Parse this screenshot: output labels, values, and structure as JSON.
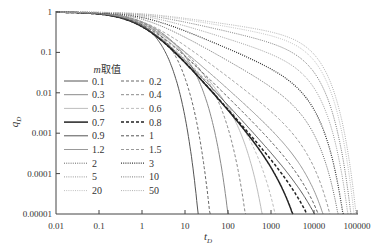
{
  "chart_data": {
    "type": "line",
    "title": "",
    "xlabel": "t_D",
    "ylabel": "q_D",
    "xscale": "log",
    "yscale": "log",
    "xlim": [
      0.01,
      100000
    ],
    "ylim": [
      1e-05,
      1
    ],
    "x_ticks": [
      "0.01",
      "0.1",
      "1",
      "10",
      "100",
      "1000",
      "10000",
      "100000"
    ],
    "y_ticks": [
      "0.00001",
      "0.0001",
      "0.001",
      "0.01",
      "0.1",
      "1"
    ],
    "grid": false,
    "legend": {
      "title": "m取值",
      "position": "inside-left",
      "columns": 2
    },
    "model_note": "curves approximated as q=(1+t)^(-p)*exp(-t/tau)",
    "series": [
      {
        "name": "0.1",
        "style": "solid",
        "color": "#555555",
        "width": 1.0,
        "p": 0.3,
        "tau": 1.9,
        "end_t": 20
      },
      {
        "name": "0.2",
        "style": "dash",
        "color": "#666666",
        "width": 1.0,
        "p": 0.5,
        "tau": 3.9,
        "end_t": 38
      },
      {
        "name": "0.3",
        "style": "solid",
        "color": "#8a8a8a",
        "width": 1.0,
        "p": 0.7,
        "tau": 12,
        "end_t": 100
      },
      {
        "name": "0.4",
        "style": "dash",
        "color": "#8a8a8a",
        "width": 1.0,
        "p": 0.85,
        "tau": 37,
        "end_t": 250
      },
      {
        "name": "0.5",
        "style": "solid",
        "color": "#bdbdbd",
        "width": 1.0,
        "p": 1.0,
        "tau": 122,
        "end_t": 620
      },
      {
        "name": "0.6",
        "style": "dash",
        "color": "#bdbdbd",
        "width": 1.0,
        "p": 1.1,
        "tau": 340,
        "end_t": 1250
      },
      {
        "name": "0.7",
        "style": "solid",
        "color": "#222222",
        "width": 1.5,
        "p": 1.2,
        "tau": 1740,
        "end_t": 3200
      },
      {
        "name": "0.8",
        "style": "dash",
        "color": "#222222",
        "width": 1.5,
        "p": 1.2,
        "tau": 7500,
        "end_t": 6900
      },
      {
        "name": "0.9",
        "style": "solid",
        "color": "#555555",
        "width": 1.0,
        "p": 1.15,
        "tau": 11400,
        "end_t": 10500
      },
      {
        "name": "1",
        "style": "dash",
        "color": "#555555",
        "width": 1.0,
        "p": 1.05,
        "tau": 7800,
        "end_t": 12500
      },
      {
        "name": "1.2",
        "style": "solid",
        "color": "#999999",
        "width": 1.0,
        "p": 0.95,
        "tau": 7000,
        "end_t": 16000
      },
      {
        "name": "1.5",
        "style": "dash",
        "color": "#999999",
        "width": 1.0,
        "p": 0.8,
        "tau": 6700,
        "end_t": 23000
      },
      {
        "name": "2",
        "style": "dot",
        "color": "#666666",
        "width": 1.0,
        "p": 0.6,
        "tau": 6900,
        "end_t": 36000
      },
      {
        "name": "3",
        "style": "dot",
        "color": "#333333",
        "width": 1.2,
        "p": 0.45,
        "tau": 7050,
        "end_t": 47000
      },
      {
        "name": "5",
        "style": "dot",
        "color": "#999999",
        "width": 1.0,
        "p": 0.33,
        "tau": 7750,
        "end_t": 61000
      },
      {
        "name": "10",
        "style": "dot",
        "color": "#777777",
        "width": 1.0,
        "p": 0.24,
        "tau": 8150,
        "end_t": 72000
      },
      {
        "name": "20",
        "style": "dot",
        "color": "#c0c0c0",
        "width": 1.0,
        "p": 0.18,
        "tau": 9000,
        "end_t": 85000
      },
      {
        "name": "50",
        "style": "dot",
        "color": "#b0b0b0",
        "width": 1.0,
        "p": 0.15,
        "tau": 9700,
        "end_t": 95000
      }
    ]
  },
  "axes": {
    "xlabel_main": "t",
    "xlabel_sub": "D",
    "ylabel_main": "q",
    "ylabel_sub": "D"
  },
  "legend": {
    "title_italic": "m",
    "title_rest": "取值"
  }
}
